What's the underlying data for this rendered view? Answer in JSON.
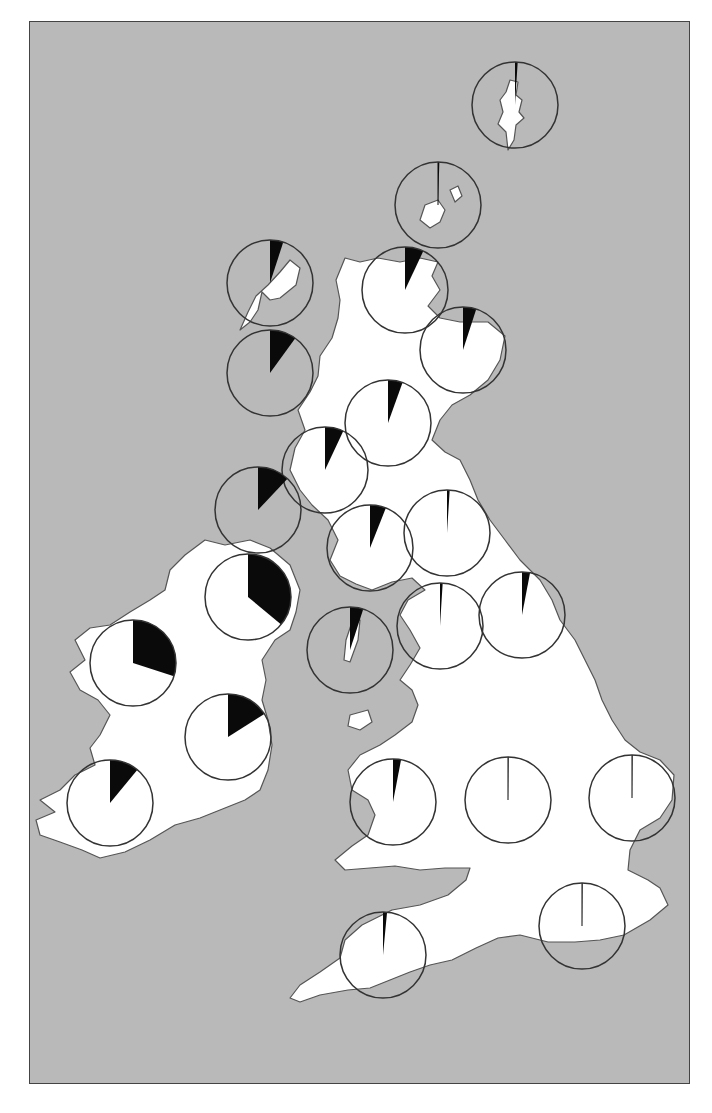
{
  "map": {
    "title": "",
    "region": "British Isles",
    "colors": {
      "sea": "#b9b9b9",
      "land": "#ffffff",
      "coast": "#555555",
      "wedge": "#0a0a0a",
      "circle_stroke": "#333333",
      "frame": "#444444"
    },
    "pie_radius": 43
  },
  "chart_data": {
    "type": "pie",
    "title": "",
    "legend": [],
    "pies": [
      {
        "name": "Shetland",
        "cx": 515,
        "cy": 105,
        "fraction": 0.01
      },
      {
        "name": "Orkney",
        "cx": 438,
        "cy": 205,
        "fraction": 0.005
      },
      {
        "name": "Outer Hebrides (Lewis)",
        "cx": 270,
        "cy": 283,
        "fraction": 0.05
      },
      {
        "name": "Northern Highlands",
        "cx": 405,
        "cy": 290,
        "fraction": 0.07
      },
      {
        "name": "North-east Scotland",
        "cx": 463,
        "cy": 350,
        "fraction": 0.05
      },
      {
        "name": "Skye / Western Isles",
        "cx": 270,
        "cy": 373,
        "fraction": 0.1
      },
      {
        "name": "Grampian",
        "cx": 388,
        "cy": 423,
        "fraction": 0.055
      },
      {
        "name": "Argyll",
        "cx": 325,
        "cy": 470,
        "fraction": 0.07
      },
      {
        "name": "Islay / Kintyre",
        "cx": 258,
        "cy": 510,
        "fraction": 0.12
      },
      {
        "name": "Borders",
        "cx": 447,
        "cy": 533,
        "fraction": 0.01
      },
      {
        "name": "Galloway",
        "cx": 370,
        "cy": 548,
        "fraction": 0.06
      },
      {
        "name": "Northern Ireland",
        "cx": 248,
        "cy": 597,
        "fraction": 0.36
      },
      {
        "name": "Northumberland",
        "cx": 522,
        "cy": 615,
        "fraction": 0.03
      },
      {
        "name": "Cumbria",
        "cx": 440,
        "cy": 626,
        "fraction": 0.01
      },
      {
        "name": "Isle of Man",
        "cx": 350,
        "cy": 650,
        "fraction": 0.05
      },
      {
        "name": "North-west Ireland",
        "cx": 133,
        "cy": 663,
        "fraction": 0.3
      },
      {
        "name": "Central Ireland",
        "cx": 228,
        "cy": 737,
        "fraction": 0.16
      },
      {
        "name": "South-west Ireland",
        "cx": 110,
        "cy": 803,
        "fraction": 0.11
      },
      {
        "name": "Wales",
        "cx": 393,
        "cy": 802,
        "fraction": 0.03
      },
      {
        "name": "Midlands",
        "cx": 508,
        "cy": 800,
        "fraction": 0.002
      },
      {
        "name": "East Anglia",
        "cx": 632,
        "cy": 798,
        "fraction": 0.002
      },
      {
        "name": "South-west England",
        "cx": 383,
        "cy": 955,
        "fraction": 0.015
      },
      {
        "name": "South-east England",
        "cx": 582,
        "cy": 926,
        "fraction": 0.002
      }
    ]
  }
}
